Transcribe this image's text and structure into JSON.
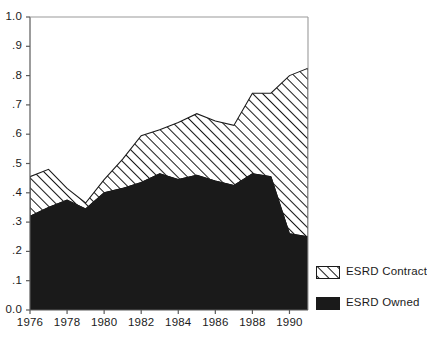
{
  "chart_data": {
    "type": "area",
    "title": "",
    "subtitle": "",
    "xlabel": "",
    "ylabel": "",
    "stacked": true,
    "grid": false,
    "legend_position": "right",
    "xlim": [
      1976,
      1991
    ],
    "ylim": [
      0.0,
      1.0
    ],
    "x": [
      1976,
      1977,
      1978,
      1979,
      1980,
      1981,
      1982,
      1983,
      1984,
      1985,
      1986,
      1987,
      1988,
      1989,
      1990,
      1991
    ],
    "xtick_labels": [
      "1976",
      "1978",
      "1980",
      "1982",
      "1984",
      "1986",
      "1988",
      "1990"
    ],
    "xticks": [
      1976,
      1978,
      1980,
      1982,
      1984,
      1986,
      1988,
      1990
    ],
    "ytick_labels": [
      "0.0",
      ".1",
      ".2",
      ".3",
      ".4",
      ".5",
      ".6",
      ".7",
      ".8",
      ".9",
      "1.0"
    ],
    "yticks": [
      0.0,
      0.1,
      0.2,
      0.3,
      0.4,
      0.5,
      0.6,
      0.7,
      0.8,
      0.9,
      1.0
    ],
    "series": [
      {
        "name": "ESRD Owned",
        "fill": "solid-black",
        "color": "#1a1a1a",
        "values": [
          0.32,
          0.35,
          0.375,
          0.345,
          0.4,
          0.415,
          0.435,
          0.465,
          0.445,
          0.46,
          0.44,
          0.425,
          0.465,
          0.455,
          0.26,
          0.25
        ]
      },
      {
        "name": "ESRD Contract",
        "fill": "diagonal-hatch",
        "color": "#1a1a1a",
        "values": [
          0.135,
          0.13,
          0.04,
          0.02,
          0.045,
          0.1,
          0.16,
          0.15,
          0.195,
          0.21,
          0.205,
          0.205,
          0.275,
          0.285,
          0.54,
          0.575
        ]
      }
    ],
    "cumulative_top": [
      0.455,
      0.48,
      0.415,
      0.365,
      0.445,
      0.515,
      0.595,
      0.615,
      0.64,
      0.67,
      0.645,
      0.63,
      0.74,
      0.74,
      0.8,
      0.825
    ]
  },
  "legend": {
    "items": [
      {
        "label": "ESRD Contract",
        "swatch": "diagonal-hatch"
      },
      {
        "label": "ESRD Owned",
        "swatch": "solid-black"
      }
    ]
  },
  "colors": {
    "axis": "#5a5a5a",
    "ink": "#1a1a1a",
    "background": "#ffffff"
  }
}
